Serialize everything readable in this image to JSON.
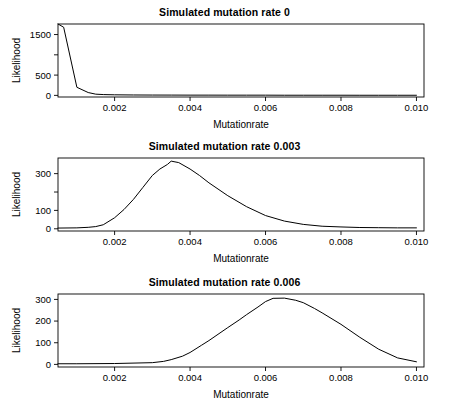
{
  "figure": {
    "background": "#ffffff",
    "line_color": "#000000",
    "axis_color": "#000000",
    "panel_count": 3
  },
  "chart_data": [
    {
      "type": "line",
      "title": "Simulated mutation rate 0",
      "xlabel": "Mutationrate",
      "ylabel": "Likelihood",
      "xlim": [
        0.0005,
        0.0102
      ],
      "ylim": [
        -40,
        1760
      ],
      "xticks": [
        0.002,
        0.004,
        0.006,
        0.008,
        0.01
      ],
      "xticklabels": [
        "0.002",
        "0.004",
        "0.006",
        "0.008",
        "0.010"
      ],
      "yticks": [
        0,
        500,
        1000,
        1500
      ],
      "yticklabels": [
        "0",
        "500",
        "",
        "1500"
      ],
      "grid": false,
      "legend": "none",
      "x": [
        0.0005,
        0.00065,
        0.001,
        0.0013,
        0.0015,
        0.0017,
        0.002,
        0.0025,
        0.003,
        0.0035,
        0.004,
        0.0045,
        0.005,
        0.0055,
        0.006,
        0.0065,
        0.007,
        0.0075,
        0.008,
        0.0085,
        0.009,
        0.0095,
        0.01
      ],
      "y": [
        1760,
        1680,
        200,
        70,
        30,
        20,
        14,
        10,
        8,
        7,
        6,
        6,
        5,
        5,
        5,
        4,
        4,
        4,
        4,
        3,
        3,
        3,
        3
      ]
    },
    {
      "type": "line",
      "title": "Simulated mutation rate 0.003",
      "xlabel": "Mutationrate",
      "ylabel": "Likelihood",
      "xlim": [
        0.0005,
        0.0102
      ],
      "ylim": [
        -12,
        385
      ],
      "xticks": [
        0.002,
        0.004,
        0.006,
        0.008,
        0.01
      ],
      "xticklabels": [
        "0.002",
        "0.004",
        "0.006",
        "0.008",
        "0.010"
      ],
      "yticks": [
        0,
        100,
        200,
        300
      ],
      "yticklabels": [
        "0",
        "100",
        "",
        "300"
      ],
      "grid": false,
      "legend": "none",
      "x": [
        0.0005,
        0.001,
        0.0013,
        0.0015,
        0.0017,
        0.002,
        0.00225,
        0.0025,
        0.00275,
        0.003,
        0.0032,
        0.0034,
        0.0035,
        0.0037,
        0.004,
        0.00425,
        0.0045,
        0.005,
        0.0055,
        0.006,
        0.0065,
        0.007,
        0.0075,
        0.008,
        0.0085,
        0.009,
        0.0095,
        0.01
      ],
      "y": [
        4,
        5,
        8,
        12,
        22,
        60,
        105,
        160,
        225,
        290,
        325,
        350,
        368,
        360,
        325,
        290,
        250,
        180,
        120,
        72,
        42,
        24,
        14,
        10,
        7,
        6,
        5,
        5
      ]
    },
    {
      "type": "line",
      "title": "Simulated mutation rate 0.006",
      "xlabel": "Mutationrate",
      "ylabel": "Likelihood",
      "xlim": [
        0.0005,
        0.0102
      ],
      "ylim": [
        -12,
        325
      ],
      "xticks": [
        0.002,
        0.004,
        0.006,
        0.008,
        0.01
      ],
      "xticklabels": [
        "0.002",
        "0.004",
        "0.006",
        "0.008",
        "0.010"
      ],
      "yticks": [
        0,
        100,
        200,
        300
      ],
      "yticklabels": [
        "0",
        "100",
        "200",
        "300"
      ],
      "grid": false,
      "legend": "none",
      "x": [
        0.0005,
        0.001,
        0.002,
        0.003,
        0.0033,
        0.0035,
        0.0038,
        0.004,
        0.0043,
        0.0045,
        0.005,
        0.0053,
        0.0055,
        0.0058,
        0.006,
        0.0062,
        0.0065,
        0.0068,
        0.007,
        0.0073,
        0.0075,
        0.008,
        0.0085,
        0.009,
        0.0095,
        0.01
      ],
      "y": [
        3,
        3,
        4,
        8,
        14,
        22,
        38,
        55,
        88,
        110,
        170,
        205,
        230,
        265,
        290,
        305,
        306,
        296,
        285,
        258,
        238,
        185,
        125,
        70,
        30,
        12
      ]
    }
  ]
}
